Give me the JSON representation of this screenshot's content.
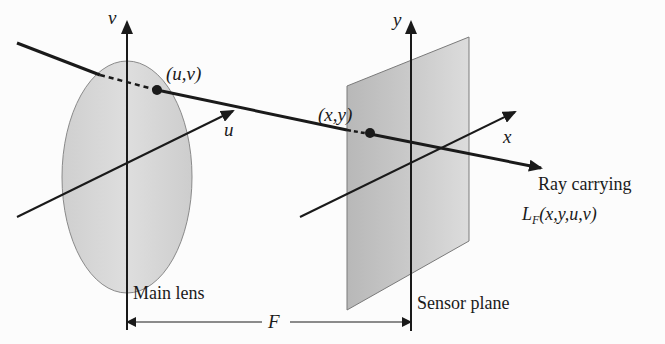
{
  "figure": {
    "colors": {
      "background": "#fcfcfc",
      "stroke": "#1a1a1a",
      "lens_fill": "#d6d6d6",
      "lens_stroke": "#8a8a8a",
      "sensor_fill_dark": "#bdbdbd",
      "sensor_fill_light": "#d9d9d9",
      "sensor_stroke": "#7a7a7a"
    },
    "lens": {
      "label": "Main lens",
      "axes": {
        "vertical": "v",
        "horizontal": "u"
      },
      "point_label": "(u,v)"
    },
    "sensor": {
      "label": "Sensor plane",
      "axes": {
        "vertical": "y",
        "horizontal": "x"
      },
      "point_label": "(x,y)"
    },
    "ray": {
      "label_line1": "Ray carrying",
      "function_name": "L",
      "function_subscript": "F",
      "function_args": "(x,y,u,v)"
    },
    "distance": {
      "label": "F"
    }
  }
}
